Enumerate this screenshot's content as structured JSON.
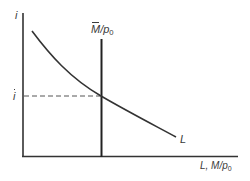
{
  "diagram": {
    "y_axis_label": "i",
    "x_axis_label_prefix": "L, M/p",
    "x_axis_label_sub": "0",
    "vertical_line_label_main": "M",
    "vertical_line_label_rest": "/p",
    "vertical_line_label_sub": "0",
    "equilibrium_label": "i",
    "curve_label": "L",
    "colors": {
      "line": "#333333",
      "dashed": "#555555",
      "background": "#ffffff"
    }
  }
}
